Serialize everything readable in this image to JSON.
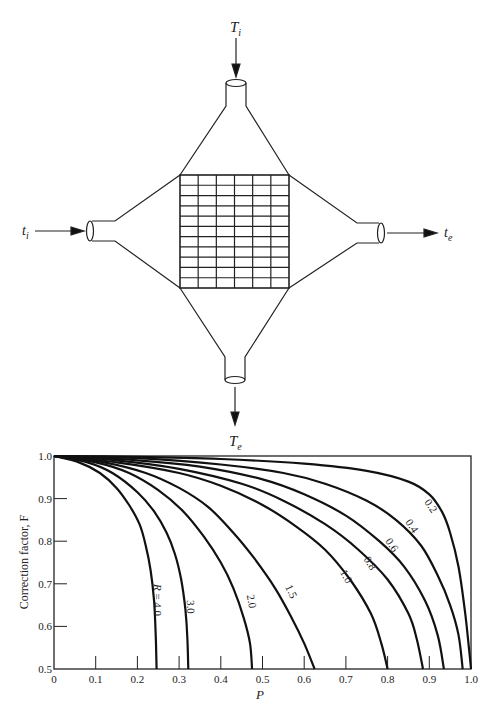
{
  "diagram": {
    "labels": {
      "hot_in": "T",
      "hot_in_sub": "i",
      "hot_out": "T",
      "hot_out_sub": "e",
      "cold_in": "t",
      "cold_in_sub": "i",
      "cold_out": "t",
      "cold_out_sub": "e"
    },
    "grid": {
      "columns": 6,
      "rows": 11
    }
  },
  "chart_data": {
    "type": "line",
    "title": "",
    "xlabel": "P",
    "ylabel": "Correction factor, F",
    "xlim": [
      0,
      1.0
    ],
    "ylim": [
      0.5,
      1.0
    ],
    "x_ticks": [
      "0",
      "0.1",
      "0.2",
      "0.3",
      "0.4",
      "0.5",
      "0.6",
      "0.7",
      "0.8",
      "0.9",
      "1.0"
    ],
    "y_ticks": [
      "0.5",
      "0.6",
      "0.7",
      "0.8",
      "0.9",
      "1.0"
    ],
    "grid": false,
    "legend": "inline curve labels",
    "series": [
      {
        "name": "0.2",
        "label": "0.2",
        "points": [
          [
            0,
            1.0
          ],
          [
            0.2,
            0.998
          ],
          [
            0.4,
            0.993
          ],
          [
            0.6,
            0.982
          ],
          [
            0.75,
            0.965
          ],
          [
            0.85,
            0.94
          ],
          [
            0.9,
            0.91
          ],
          [
            0.93,
            0.87
          ],
          [
            0.95,
            0.82
          ],
          [
            0.97,
            0.74
          ],
          [
            0.985,
            0.64
          ],
          [
            0.995,
            0.55
          ],
          [
            1.0,
            0.5
          ]
        ]
      },
      {
        "name": "0.4",
        "label": "0.4",
        "points": [
          [
            0,
            1.0
          ],
          [
            0.2,
            0.995
          ],
          [
            0.4,
            0.98
          ],
          [
            0.55,
            0.96
          ],
          [
            0.65,
            0.935
          ],
          [
            0.75,
            0.895
          ],
          [
            0.82,
            0.85
          ],
          [
            0.88,
            0.79
          ],
          [
            0.92,
            0.72
          ],
          [
            0.95,
            0.65
          ],
          [
            0.97,
            0.58
          ],
          [
            0.98,
            0.5
          ]
        ]
      },
      {
        "name": "0.6",
        "label": "0.6",
        "points": [
          [
            0,
            1.0
          ],
          [
            0.2,
            0.99
          ],
          [
            0.35,
            0.975
          ],
          [
            0.5,
            0.945
          ],
          [
            0.6,
            0.91
          ],
          [
            0.7,
            0.86
          ],
          [
            0.78,
            0.8
          ],
          [
            0.84,
            0.74
          ],
          [
            0.89,
            0.66
          ],
          [
            0.92,
            0.58
          ],
          [
            0.935,
            0.5
          ]
        ]
      },
      {
        "name": "0.8",
        "label": "0.8",
        "points": [
          [
            0,
            1.0
          ],
          [
            0.15,
            0.99
          ],
          [
            0.3,
            0.97
          ],
          [
            0.45,
            0.935
          ],
          [
            0.55,
            0.895
          ],
          [
            0.65,
            0.84
          ],
          [
            0.73,
            0.78
          ],
          [
            0.8,
            0.71
          ],
          [
            0.85,
            0.63
          ],
          [
            0.87,
            0.57
          ],
          [
            0.885,
            0.5
          ]
        ]
      },
      {
        "name": "1.0",
        "label": "1.0",
        "points": [
          [
            0,
            1.0
          ],
          [
            0.15,
            0.985
          ],
          [
            0.3,
            0.96
          ],
          [
            0.4,
            0.93
          ],
          [
            0.5,
            0.885
          ],
          [
            0.58,
            0.835
          ],
          [
            0.65,
            0.78
          ],
          [
            0.71,
            0.71
          ],
          [
            0.76,
            0.63
          ],
          [
            0.785,
            0.56
          ],
          [
            0.8,
            0.5
          ]
        ]
      },
      {
        "name": "1.5",
        "label": "1.5",
        "points": [
          [
            0,
            1.0
          ],
          [
            0.12,
            0.985
          ],
          [
            0.22,
            0.96
          ],
          [
            0.3,
            0.925
          ],
          [
            0.37,
            0.88
          ],
          [
            0.43,
            0.82
          ],
          [
            0.48,
            0.76
          ],
          [
            0.53,
            0.69
          ],
          [
            0.57,
            0.62
          ],
          [
            0.6,
            0.56
          ],
          [
            0.625,
            0.5
          ]
        ]
      },
      {
        "name": "2.0",
        "label": "2.0",
        "points": [
          [
            0,
            1.0
          ],
          [
            0.1,
            0.985
          ],
          [
            0.18,
            0.96
          ],
          [
            0.25,
            0.92
          ],
          [
            0.31,
            0.87
          ],
          [
            0.36,
            0.81
          ],
          [
            0.4,
            0.75
          ],
          [
            0.43,
            0.69
          ],
          [
            0.455,
            0.62
          ],
          [
            0.47,
            0.56
          ],
          [
            0.475,
            0.5
          ]
        ]
      },
      {
        "name": "3.0",
        "label": "3.0",
        "points": [
          [
            0,
            1.0
          ],
          [
            0.08,
            0.985
          ],
          [
            0.14,
            0.96
          ],
          [
            0.2,
            0.915
          ],
          [
            0.24,
            0.87
          ],
          [
            0.27,
            0.82
          ],
          [
            0.29,
            0.77
          ],
          [
            0.305,
            0.71
          ],
          [
            0.315,
            0.64
          ],
          [
            0.32,
            0.57
          ],
          [
            0.322,
            0.5
          ]
        ]
      },
      {
        "name": "4.0",
        "label": "R = 4.0",
        "points": [
          [
            0,
            1.0
          ],
          [
            0.06,
            0.985
          ],
          [
            0.11,
            0.96
          ],
          [
            0.15,
            0.925
          ],
          [
            0.18,
            0.885
          ],
          [
            0.205,
            0.84
          ],
          [
            0.22,
            0.79
          ],
          [
            0.232,
            0.73
          ],
          [
            0.24,
            0.66
          ],
          [
            0.244,
            0.58
          ],
          [
            0.246,
            0.5
          ]
        ]
      }
    ]
  }
}
